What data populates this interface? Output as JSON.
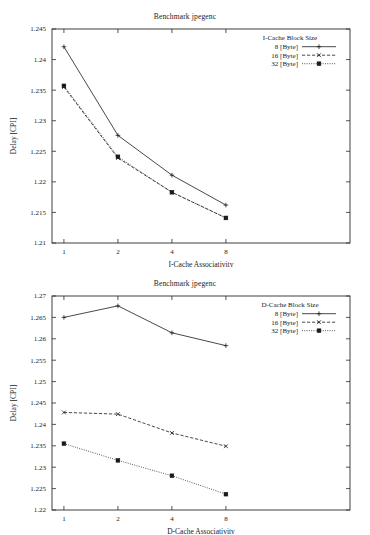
{
  "document": {
    "kind": "two-panel-line-chart-figure"
  },
  "charts": [
    {
      "id": "icache",
      "title": "Benchmark jpegenc",
      "xlabel": "I-Cache Associativity",
      "ylabel": "Delay [CPI]",
      "legend_title": "I-Cache Block Size",
      "xtick_labels": [
        "1",
        "2",
        "4",
        "8"
      ],
      "ytick_labels": [
        "1.21",
        "1.215",
        "1.22",
        "1.225",
        "1.23",
        "1.235",
        "1.24",
        "1.245"
      ]
    },
    {
      "id": "dcache",
      "title": "Benchmark jpegenc",
      "xlabel": "D-Cache Associativity",
      "ylabel": "Delay [CPI]",
      "legend_title": "D-Cache Block Size",
      "xtick_labels": [
        "1",
        "2",
        "4",
        "8"
      ],
      "ytick_labels": [
        "1.22",
        "1.225",
        "1.23",
        "1.235",
        "1.24",
        "1.245",
        "1.25",
        "1.255",
        "1.26",
        "1.265",
        "1.27"
      ]
    }
  ],
  "chart_data": [
    {
      "type": "line",
      "title": "Benchmark jpegenc",
      "xlabel": "I-Cache Associativity",
      "ylabel": "Delay [CPI]",
      "legend_title": "I-Cache Block Size",
      "legend_position": "top-right inside plot",
      "grid": false,
      "x": [
        1,
        2,
        4,
        8
      ],
      "xtick_labels": [
        "1",
        "2",
        "4",
        "8"
      ],
      "xscale": "categorical",
      "ylim": [
        1.21,
        1.245
      ],
      "ytick_values": [
        1.21,
        1.215,
        1.22,
        1.225,
        1.23,
        1.235,
        1.24,
        1.245
      ],
      "ytick_labels": [
        "1.21",
        "1.215",
        "1.22",
        "1.225",
        "1.23",
        "1.235",
        "1.24",
        "1.245"
      ],
      "series": [
        {
          "name": "8 [Byte]",
          "line_style": "solid",
          "marker": "plus",
          "values": [
            1.2421,
            1.2276,
            1.2211,
            1.2162
          ]
        },
        {
          "name": "16 [Byte]",
          "line_style": "dashed",
          "marker": "cross",
          "values": [
            1.2355,
            1.2239,
            1.2183,
            1.2141
          ]
        },
        {
          "name": "32 [Byte]",
          "line_style": "dotted",
          "marker": "filled-square",
          "values": [
            1.2357,
            1.2241,
            1.2183,
            1.2141
          ]
        }
      ]
    },
    {
      "type": "line",
      "title": "Benchmark jpegenc",
      "xlabel": "D-Cache Associativity",
      "ylabel": "Delay [CPI]",
      "legend_title": "D-Cache Block Size",
      "legend_position": "top-right inside plot",
      "grid": false,
      "x": [
        1,
        2,
        4,
        8
      ],
      "xtick_labels": [
        "1",
        "2",
        "4",
        "8"
      ],
      "xscale": "categorical",
      "ylim": [
        1.22,
        1.27
      ],
      "ytick_values": [
        1.22,
        1.225,
        1.23,
        1.235,
        1.24,
        1.245,
        1.25,
        1.255,
        1.26,
        1.265,
        1.27
      ],
      "ytick_labels": [
        "1.22",
        "1.225",
        "1.23",
        "1.235",
        "1.24",
        "1.245",
        "1.25",
        "1.255",
        "1.26",
        "1.265",
        "1.27"
      ],
      "series": [
        {
          "name": "8 [Byte]",
          "line_style": "solid",
          "marker": "plus",
          "values": [
            1.265,
            1.2677,
            1.2614,
            1.2584
          ]
        },
        {
          "name": "16 [Byte]",
          "line_style": "dashed",
          "marker": "cross",
          "values": [
            1.2428,
            1.2424,
            1.238,
            1.2349
          ]
        },
        {
          "name": "32 [Byte]",
          "line_style": "dotted",
          "marker": "filled-square",
          "values": [
            1.2355,
            1.2316,
            1.228,
            1.2237
          ]
        }
      ]
    }
  ]
}
